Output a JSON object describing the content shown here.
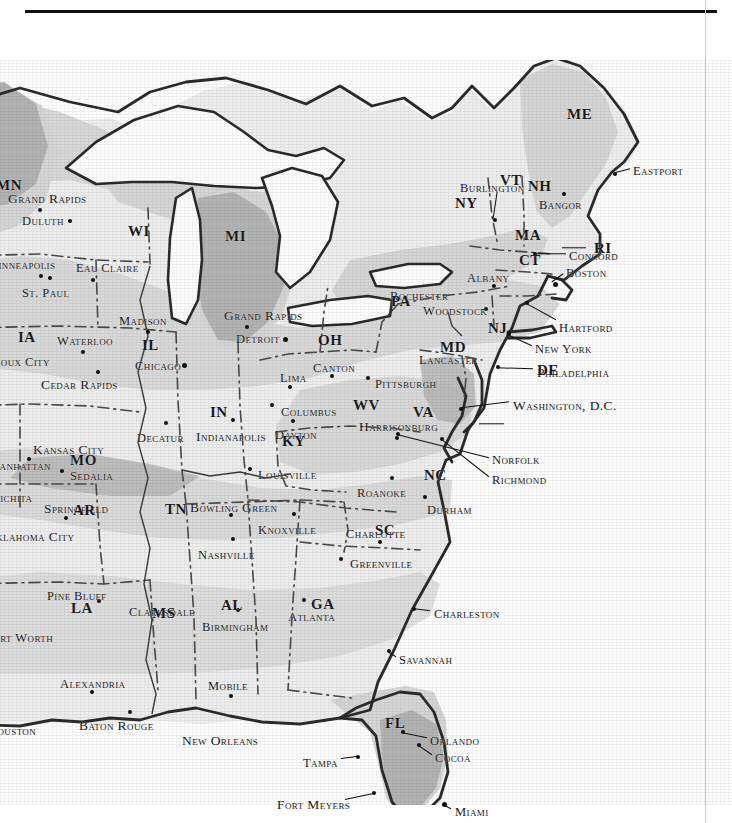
{
  "document": {
    "type": "scanned-atlas-page",
    "title_faint_bleedthrough": "",
    "has_top_rule": true,
    "has_right_margin_rule": true
  },
  "map": {
    "region": "Eastern United States",
    "projection_note": "",
    "shading": {
      "land_light": "#f1f1f1",
      "zone_mid": "#d9d9d9",
      "zone_dark": "#b5b5b5",
      "water": "#ffffff",
      "outline": "#2b2b2b",
      "state_border": "#4a4a4a"
    }
  },
  "states": [
    {
      "abbr": "MN",
      "x": -4,
      "y": 118,
      "clipped": true
    },
    {
      "abbr": "WI",
      "x": 128,
      "y": 164
    },
    {
      "abbr": "MI",
      "x": 225,
      "y": 169
    },
    {
      "abbr": "IA",
      "x": 18,
      "y": 270
    },
    {
      "abbr": "IL",
      "x": 142,
      "y": 278
    },
    {
      "abbr": "IN",
      "x": 210,
      "y": 345
    },
    {
      "abbr": "OH",
      "x": 318,
      "y": 273
    },
    {
      "abbr": "PA",
      "x": 391,
      "y": 234
    },
    {
      "abbr": "NY",
      "x": 455,
      "y": 136
    },
    {
      "abbr": "VT",
      "x": 500,
      "y": 113
    },
    {
      "abbr": "NH",
      "x": 528,
      "y": 119
    },
    {
      "abbr": "ME",
      "x": 567,
      "y": 47
    },
    {
      "abbr": "MA",
      "x": 515,
      "y": 168
    },
    {
      "abbr": "RI",
      "x": 594,
      "y": 181
    },
    {
      "abbr": "CT",
      "x": 519,
      "y": 193
    },
    {
      "abbr": "NJ",
      "x": 488,
      "y": 261
    },
    {
      "abbr": "MD",
      "x": 440,
      "y": 280
    },
    {
      "abbr": "DE",
      "x": 537,
      "y": 303
    },
    {
      "abbr": "WV",
      "x": 353,
      "y": 338
    },
    {
      "abbr": "VA",
      "x": 413,
      "y": 345
    },
    {
      "abbr": "KY",
      "x": 282,
      "y": 374
    },
    {
      "abbr": "MO",
      "x": 70,
      "y": 393
    },
    {
      "abbr": "AR",
      "x": 73,
      "y": 443
    },
    {
      "abbr": "TN",
      "x": 165,
      "y": 442
    },
    {
      "abbr": "NC",
      "x": 424,
      "y": 408
    },
    {
      "abbr": "SC",
      "x": 375,
      "y": 463
    },
    {
      "abbr": "GA",
      "x": 311,
      "y": 537
    },
    {
      "abbr": "AL",
      "x": 221,
      "y": 538
    },
    {
      "abbr": "MS",
      "x": 152,
      "y": 546
    },
    {
      "abbr": "LA",
      "x": 71,
      "y": 541
    },
    {
      "abbr": "FL",
      "x": 385,
      "y": 656
    }
  ],
  "cities": [
    {
      "name": "Grand Rapids",
      "lx": 8,
      "ly": 132,
      "dx": 38,
      "dy": 148,
      "anchor": "center-below",
      "clipped": true
    },
    {
      "name": "Duluth",
      "lx": 22,
      "ly": 155,
      "dx": 68,
      "dy": 159,
      "anchor": "right"
    },
    {
      "name": "Minneapolis",
      "lx": -14,
      "ly": 198,
      "dx": 39,
      "dy": 214,
      "anchor": "center-below",
      "clipped": true
    },
    {
      "name": "St. Paul",
      "lx": 22,
      "ly": 227,
      "dx": 48,
      "dy": 216,
      "anchor": "center-above"
    },
    {
      "name": "Eau Claire",
      "lx": 76,
      "ly": 202,
      "dx": 91,
      "dy": 218,
      "anchor": "center-below"
    },
    {
      "name": "Madison",
      "lx": 119,
      "ly": 255,
      "dx": 146,
      "dy": 270,
      "anchor": "center-below"
    },
    {
      "name": "Waterloo",
      "lx": 57,
      "ly": 275,
      "dx": 81,
      "dy": 290,
      "anchor": "center-below"
    },
    {
      "name": "Sioux City",
      "lx": -10,
      "ly": 296,
      "dx": 0,
      "dy": 0,
      "anchor": "none",
      "clipped": true
    },
    {
      "name": "Cedar Rapids",
      "lx": 41,
      "ly": 318,
      "dx": 96,
      "dy": 310,
      "anchor": "center-above"
    },
    {
      "name": "Chicago",
      "lx": 135,
      "ly": 300,
      "dx": 182,
      "dy": 303,
      "anchor": "right"
    },
    {
      "name": "Grand Rapids",
      "lx": 224,
      "ly": 249,
      "dx": 245,
      "dy": 265,
      "anchor": "center-below"
    },
    {
      "name": "Detroit",
      "lx": 236,
      "ly": 273,
      "dx": 283,
      "dy": 277,
      "anchor": "right"
    },
    {
      "name": "Lima",
      "lx": 280,
      "ly": 312,
      "dx": 288,
      "dy": 325,
      "anchor": "center-below"
    },
    {
      "name": "Canton",
      "lx": 313,
      "ly": 302,
      "dx": 330,
      "dy": 314,
      "anchor": "center-below"
    },
    {
      "name": "Columbus",
      "lx": 281,
      "ly": 346,
      "dx": 270,
      "dy": 343,
      "anchor": "left"
    },
    {
      "name": "Pittsburgh",
      "lx": 375,
      "ly": 318,
      "dx": 366,
      "dy": 316,
      "anchor": "left"
    },
    {
      "name": "Lancaster",
      "lx": 419,
      "ly": 294,
      "dx": 478,
      "dy": 307,
      "anchor": "none"
    },
    {
      "name": "Rochester",
      "lx": 390,
      "ly": 230,
      "dx": 0,
      "dy": 0,
      "anchor": "none"
    },
    {
      "name": "Woodstock",
      "lx": 423,
      "ly": 245,
      "dx": 484,
      "dy": 247,
      "anchor": "right"
    },
    {
      "name": "Albany",
      "lx": 467,
      "ly": 212,
      "dx": 492,
      "dy": 224,
      "anchor": "center-below"
    },
    {
      "name": "Burlington",
      "lx": 460,
      "ly": 122,
      "dx": 493,
      "dy": 158,
      "anchor": "leader"
    },
    {
      "name": "Bangor",
      "lx": 539,
      "ly": 139,
      "dx": 562,
      "dy": 132,
      "anchor": "center-above"
    },
    {
      "name": "Eastport",
      "lx": 633,
      "ly": 105,
      "dx": 613,
      "dy": 112,
      "anchor": "leader-left"
    },
    {
      "name": "Concord",
      "lx": 569,
      "ly": 190,
      "dx": 533,
      "dy": 192,
      "anchor": "leader-left"
    },
    {
      "name": "Boston",
      "lx": 566,
      "ly": 207,
      "dx": 553,
      "dy": 222,
      "anchor": "leader-left"
    },
    {
      "name": "Hartford",
      "lx": 559,
      "ly": 262,
      "dx": 525,
      "dy": 241,
      "anchor": "leader-left"
    },
    {
      "name": "New York",
      "lx": 535,
      "ly": 283,
      "dx": 507,
      "dy": 272,
      "anchor": "leader-left"
    },
    {
      "name": "Philadelphia",
      "lx": 537,
      "ly": 306,
      "dx": 496,
      "dy": 305,
      "anchor": "leader-left"
    },
    {
      "name": "Washington, D.C.",
      "lx": 513,
      "ly": 339,
      "dx": 459,
      "dy": 347,
      "anchor": "leader-left"
    },
    {
      "name": "Decatur",
      "lx": 137,
      "ly": 372,
      "dx": 164,
      "dy": 361,
      "anchor": "center-above"
    },
    {
      "name": "Indianapolis",
      "lx": 196,
      "ly": 370,
      "dx": 231,
      "dy": 358,
      "anchor": "center-above"
    },
    {
      "name": "Dayton",
      "lx": 275,
      "ly": 369,
      "dx": 291,
      "dy": 359,
      "anchor": "center-above"
    },
    {
      "name": "Harrisonburg",
      "lx": 359,
      "ly": 360,
      "dx": 395,
      "dy": 376,
      "anchor": "center-below"
    },
    {
      "name": "Kansas City",
      "lx": 33,
      "ly": 383,
      "dx": 27,
      "dy": 397,
      "anchor": "center-below"
    },
    {
      "name": "Manhattan",
      "lx": -12,
      "ly": 400,
      "dx": 0,
      "dy": 0,
      "anchor": "none",
      "clipped": true
    },
    {
      "name": "Sedalia",
      "lx": 70,
      "ly": 410,
      "dx": 60,
      "dy": 409,
      "anchor": "left"
    },
    {
      "name": "Springfield",
      "lx": 44,
      "ly": 442,
      "dx": 64,
      "dy": 456,
      "anchor": "center-below"
    },
    {
      "name": "Wichita",
      "lx": -12,
      "ly": 432,
      "dx": 0,
      "dy": 0,
      "anchor": "none",
      "clipped": true
    },
    {
      "name": "Oklahoma City",
      "lx": -14,
      "ly": 470,
      "dx": 0,
      "dy": 0,
      "anchor": "none",
      "clipped": true
    },
    {
      "name": "Louisville",
      "lx": 258,
      "ly": 409,
      "dx": 248,
      "dy": 407,
      "anchor": "left"
    },
    {
      "name": "Bowling Green",
      "lx": 190,
      "ly": 441,
      "dx": 229,
      "dy": 453,
      "anchor": "center-below"
    },
    {
      "name": "Roanoke",
      "lx": 357,
      "ly": 427,
      "dx": 390,
      "dy": 416,
      "anchor": "center-above"
    },
    {
      "name": "Durham",
      "lx": 427,
      "ly": 444,
      "dx": 423,
      "dy": 435,
      "anchor": "center-above"
    },
    {
      "name": "Knoxville",
      "lx": 258,
      "ly": 464,
      "dx": 292,
      "dy": 452,
      "anchor": "center-above"
    },
    {
      "name": "Charlotte",
      "lx": 346,
      "ly": 468,
      "dx": 378,
      "dy": 480,
      "anchor": "center-below"
    },
    {
      "name": "Nashville",
      "lx": 198,
      "ly": 489,
      "dx": 231,
      "dy": 477,
      "anchor": "center-above"
    },
    {
      "name": "Greenville",
      "lx": 350,
      "ly": 498,
      "dx": 339,
      "dy": 497,
      "anchor": "left"
    },
    {
      "name": "Norfolk",
      "lx": 492,
      "ly": 394,
      "dx": 396,
      "dy": 372,
      "anchor": "leader-left"
    },
    {
      "name": "Richmond",
      "lx": 492,
      "ly": 414,
      "dx": 440,
      "dy": 377,
      "anchor": "leader-left"
    },
    {
      "name": "Pine Bluff",
      "lx": 47,
      "ly": 530,
      "dx": 97,
      "dy": 539,
      "anchor": "center-below"
    },
    {
      "name": "Clarksdale",
      "lx": 129,
      "ly": 546,
      "dx": 0,
      "dy": 0,
      "anchor": "none"
    },
    {
      "name": "Birmingham",
      "lx": 202,
      "ly": 561,
      "dx": 236,
      "dy": 548,
      "anchor": "center-above"
    },
    {
      "name": "Atlanta",
      "lx": 288,
      "ly": 551,
      "dx": 302,
      "dy": 538,
      "anchor": "center-above"
    },
    {
      "name": "Charleston",
      "lx": 434,
      "ly": 548,
      "dx": 412,
      "dy": 547,
      "anchor": "leader-left"
    },
    {
      "name": "Savannah",
      "lx": 399,
      "ly": 594,
      "dx": 387,
      "dy": 589,
      "anchor": "leader-left"
    },
    {
      "name": "Alexandria",
      "lx": 60,
      "ly": 618,
      "dx": 90,
      "dy": 630,
      "anchor": "center-below"
    },
    {
      "name": "Mobile",
      "lx": 208,
      "ly": 620,
      "dx": 229,
      "dy": 634,
      "anchor": "center-below"
    },
    {
      "name": "Fort Worth",
      "lx": -14,
      "ly": 572,
      "dx": 0,
      "dy": 0,
      "anchor": "none",
      "clipped": true
    },
    {
      "name": "Baton Rouge",
      "lx": 79,
      "ly": 659,
      "dx": 128,
      "dy": 650,
      "anchor": "center-above"
    },
    {
      "name": "Houston",
      "lx": -12,
      "ly": 665,
      "dx": 0,
      "dy": 0,
      "anchor": "none",
      "clipped": true
    },
    {
      "name": "New Orleans",
      "lx": 182,
      "ly": 674,
      "dx": 158,
      "dy": 661,
      "anchor": "none"
    },
    {
      "name": "Orlando",
      "lx": 430,
      "ly": 675,
      "dx": 401,
      "dy": 670,
      "anchor": "leader-left"
    },
    {
      "name": "Cocoa",
      "lx": 435,
      "ly": 692,
      "dx": 417,
      "dy": 683,
      "anchor": "leader-left"
    },
    {
      "name": "Tampa",
      "lx": 303,
      "ly": 697,
      "dx": 356,
      "dy": 695,
      "anchor": "leader-right"
    },
    {
      "name": "Fort Meyers",
      "lx": 277,
      "ly": 738,
      "dx": 372,
      "dy": 731,
      "anchor": "leader-right"
    },
    {
      "name": "Miami",
      "lx": 455,
      "ly": 746,
      "dx": 442,
      "dy": 742,
      "anchor": "leader-left"
    }
  ],
  "leaders": [
    {
      "from_x": 497,
      "from_y": 131,
      "to_x": 493,
      "to_y": 158,
      "name": "burlington"
    },
    {
      "from_x": 630,
      "from_y": 108,
      "to_x": 614,
      "to_y": 112,
      "name": "eastport"
    },
    {
      "from_x": 566,
      "from_y": 193,
      "to_x": 534,
      "to_y": 193,
      "name": "concord"
    },
    {
      "from_x": 563,
      "from_y": 213,
      "to_x": 552,
      "to_y": 221,
      "name": "boston"
    },
    {
      "from_x": 556,
      "from_y": 259,
      "to_x": 527,
      "to_y": 243,
      "name": "hartford"
    },
    {
      "from_x": 532,
      "from_y": 285,
      "to_x": 508,
      "to_y": 274,
      "name": "new-york"
    },
    {
      "from_x": 533,
      "from_y": 308,
      "to_x": 497,
      "to_y": 307,
      "name": "philadelphia"
    },
    {
      "from_x": 509,
      "from_y": 341,
      "to_x": 461,
      "to_y": 347,
      "name": "washington-dc"
    },
    {
      "from_x": 504,
      "from_y": 363,
      "to_x": 479,
      "to_y": 363,
      "name": "delaware"
    },
    {
      "from_x": 586,
      "from_y": 187,
      "to_x": 562,
      "to_y": 187,
      "name": "rhode-island"
    },
    {
      "from_x": 489,
      "from_y": 397,
      "to_x": 398,
      "to_y": 374,
      "name": "norfolk"
    },
    {
      "from_x": 489,
      "from_y": 416,
      "to_x": 442,
      "to_y": 379,
      "name": "richmond"
    },
    {
      "from_x": 430,
      "from_y": 550,
      "to_x": 414,
      "to_y": 548,
      "name": "charleston"
    },
    {
      "from_x": 396,
      "from_y": 596,
      "to_x": 388,
      "to_y": 591,
      "name": "savannah"
    },
    {
      "from_x": 427,
      "from_y": 677,
      "to_x": 403,
      "to_y": 672,
      "name": "orlando"
    },
    {
      "from_x": 432,
      "from_y": 694,
      "to_x": 419,
      "to_y": 685,
      "name": "cocoa"
    },
    {
      "from_x": 341,
      "from_y": 698,
      "to_x": 357,
      "to_y": 696,
      "name": "tampa"
    },
    {
      "from_x": 345,
      "from_y": 739,
      "to_x": 373,
      "to_y": 733,
      "name": "fort-meyers"
    },
    {
      "from_x": 451,
      "from_y": 748,
      "to_x": 443,
      "to_y": 744,
      "name": "miami"
    },
    {
      "from_x": 481,
      "from_y": 249,
      "to_x": 486,
      "to_y": 249,
      "name": "woodstock"
    }
  ]
}
